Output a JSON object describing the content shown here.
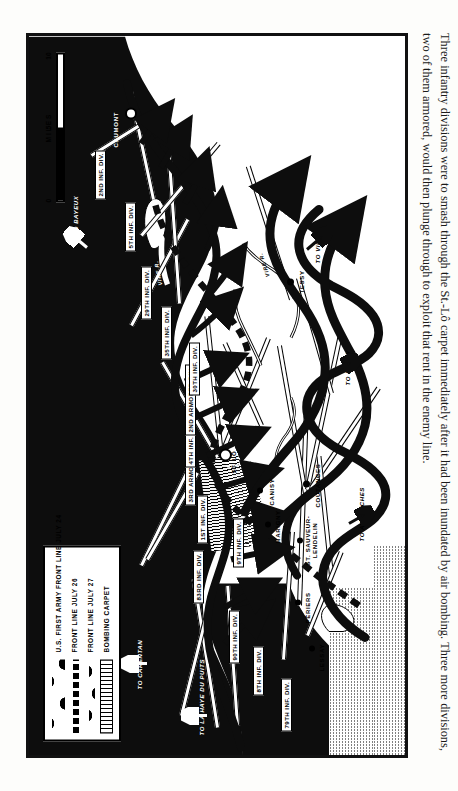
{
  "caption": {
    "text": "Three infantry divisions were to smash through the St.-Lô carpet immediately after it had been inundated by air bombing. Three more divisions, two of them armored, would then plunge through to exploit that rent in the enemy line."
  },
  "legend": {
    "items": [
      {
        "label": "U.S. FIRST ARMY FRONT LINE JULY 24",
        "symbol": "thick-wavy-line"
      },
      {
        "label": "FRONT LINE JULY 26",
        "symbol": "dashed-heavy-line"
      },
      {
        "label": "FRONT LINE JULY 27",
        "symbol": "thick-wavy-line"
      },
      {
        "label": "BOMBING CARPET",
        "symbol": "vertical-hatch-block"
      }
    ]
  },
  "scale": {
    "title": "MILES",
    "ticks": [
      "0",
      "5",
      "10"
    ]
  },
  "divisions": [
    {
      "label": "79TH INF. DIV."
    },
    {
      "label": "8TH INF. DIV."
    },
    {
      "label": "90TH INF. DIV."
    },
    {
      "label": "83RD INF. DIV."
    },
    {
      "label": "9TH INF. DIV."
    },
    {
      "label": "1ST INF. DIV."
    },
    {
      "label": "3RD ARMORED DIV."
    },
    {
      "label": "4TH INF. DIV."
    },
    {
      "label": "2ND ARMORED DIV."
    },
    {
      "label": "30TH INF. DIV."
    },
    {
      "label": "35TH INF. DIV."
    },
    {
      "label": "29TH INF. DIV."
    },
    {
      "label": "5TH INF. DIV."
    },
    {
      "label": "2ND INF. DIV."
    }
  ],
  "towns": [
    {
      "label": "LESSAY"
    },
    {
      "label": "PÉRIERS"
    },
    {
      "label": "ST. SAUVEUR-\nLENDELIN"
    },
    {
      "label": "COUTANCES"
    },
    {
      "label": "MARIGNY"
    },
    {
      "label": "CANISY"
    },
    {
      "label": "ST. LÔ"
    },
    {
      "label": "TESSY"
    },
    {
      "label": "CAUMONT"
    }
  ],
  "directions": [
    {
      "label": "TO LA HAYE DU PUITS"
    },
    {
      "label": "TO CARENTAN"
    },
    {
      "label": "TO BAYEUX"
    },
    {
      "label": "TO VIRE"
    },
    {
      "label": "TO PERCY"
    },
    {
      "label": "TO AVRANCHES"
    }
  ],
  "rivers": [
    {
      "label": "VIRE R."
    },
    {
      "label": "VIRE R."
    }
  ],
  "colors": {
    "ink": "#0d0d0d",
    "paper": "#ffffff",
    "page": "#fdfdfb"
  }
}
